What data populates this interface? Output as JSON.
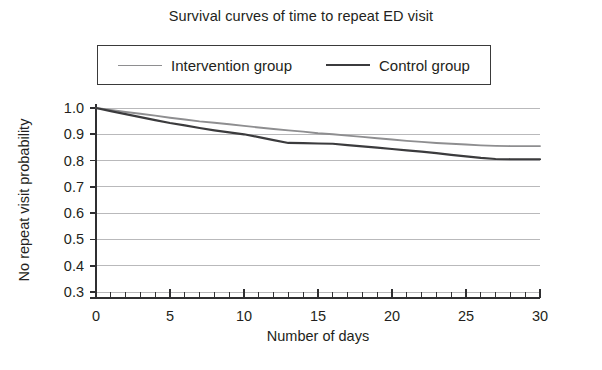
{
  "chart_data": {
    "type": "line",
    "title": "Survival curves of time to repeat ED visit",
    "xlabel": "Number of days",
    "ylabel": "No repeat visit probability",
    "xlim": [
      0,
      30
    ],
    "ylim": [
      0.3,
      1.0
    ],
    "xticks": [
      0,
      5,
      10,
      15,
      20,
      25,
      30
    ],
    "xtick_labels": [
      "0",
      "5",
      "10",
      "15",
      "20",
      "25",
      "30"
    ],
    "xminor_tick_interval": 1,
    "yticks": [
      0.3,
      0.4,
      0.5,
      0.6,
      0.7,
      0.8,
      0.9,
      1.0
    ],
    "ytick_labels": [
      "0.3",
      "0.4",
      "0.5",
      "0.6",
      "0.7",
      "0.8",
      "0.9",
      "1.0"
    ],
    "grid": "horizontal",
    "legend_position": "top-center-boxed",
    "series": [
      {
        "name": "Intervention group",
        "color": "#8e8e90",
        "x": [
          0,
          1,
          2,
          3,
          4,
          5,
          6,
          7,
          8,
          9,
          10,
          11,
          12,
          13,
          14,
          15,
          16,
          17,
          18,
          19,
          20,
          21,
          22,
          23,
          24,
          25,
          26,
          27,
          28,
          29,
          30
        ],
        "values": [
          1.0,
          0.993,
          0.985,
          0.978,
          0.971,
          0.963,
          0.956,
          0.949,
          0.944,
          0.938,
          0.932,
          0.926,
          0.92,
          0.915,
          0.91,
          0.904,
          0.9,
          0.895,
          0.89,
          0.885,
          0.88,
          0.875,
          0.871,
          0.867,
          0.864,
          0.861,
          0.858,
          0.856,
          0.855,
          0.855,
          0.855
        ]
      },
      {
        "name": "Control group",
        "color": "#3b3b3d",
        "x": [
          0,
          1,
          2,
          3,
          4,
          5,
          6,
          7,
          8,
          9,
          10,
          11,
          12,
          13,
          14,
          15,
          16,
          17,
          18,
          19,
          20,
          21,
          22,
          23,
          24,
          25,
          26,
          27,
          28,
          29,
          30
        ],
        "values": [
          1.0,
          0.988,
          0.977,
          0.965,
          0.954,
          0.943,
          0.934,
          0.924,
          0.915,
          0.907,
          0.9,
          0.889,
          0.878,
          0.867,
          0.866,
          0.865,
          0.864,
          0.859,
          0.854,
          0.849,
          0.844,
          0.839,
          0.834,
          0.828,
          0.822,
          0.816,
          0.81,
          0.806,
          0.805,
          0.805,
          0.805
        ]
      }
    ]
  },
  "legend": {
    "entries": [
      {
        "label": "Intervention group"
      },
      {
        "label": "Control group"
      }
    ]
  }
}
